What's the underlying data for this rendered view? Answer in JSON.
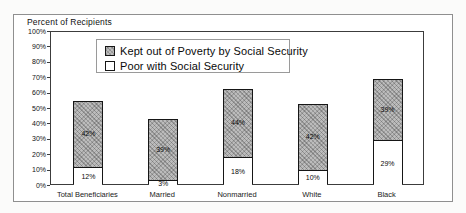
{
  "figure": {
    "title": "Percent of Recipients"
  },
  "legend": {
    "items": [
      {
        "label": "Kept out of Poverty by Social Security",
        "swatch": "gray-hatched"
      },
      {
        "label": "Poor with Social Security",
        "swatch": "white"
      }
    ]
  },
  "colors": {
    "kept_out_fill": "#bcbcbc",
    "poor_fill": "#ffffff",
    "bar_border": "#161616",
    "plot_frame": "#3c3c3c",
    "outer_border": "#8f8f8f"
  },
  "chart_data": {
    "type": "bar",
    "stacked": true,
    "title": "Percent of Recipients",
    "categories": [
      "Total Beneficiaries",
      "Married",
      "Nonmarried",
      "White",
      "Black"
    ],
    "series": [
      {
        "name": "Poor with Social Security",
        "values": [
          12,
          3,
          18,
          10,
          29
        ],
        "labels": [
          "12%",
          "3%",
          "18%",
          "10%",
          "29%"
        ]
      },
      {
        "name": "Kept out of Poverty by Social Security",
        "values": [
          42,
          39,
          44,
          42,
          39
        ],
        "labels": [
          "42%",
          "39%",
          "44%",
          "42%",
          "39%"
        ]
      }
    ],
    "totals": [
      54,
      42,
      62,
      52,
      68
    ],
    "xlabel": "",
    "ylabel": "Percent of Recipients",
    "ylim": [
      0,
      100
    ],
    "ytick_step": 10,
    "yticks": [
      "0%",
      "10%",
      "20%",
      "30%",
      "40%",
      "50%",
      "60%",
      "70%",
      "80%",
      "90%",
      "100%"
    ],
    "grid": false,
    "legend_position": "top-inside"
  }
}
